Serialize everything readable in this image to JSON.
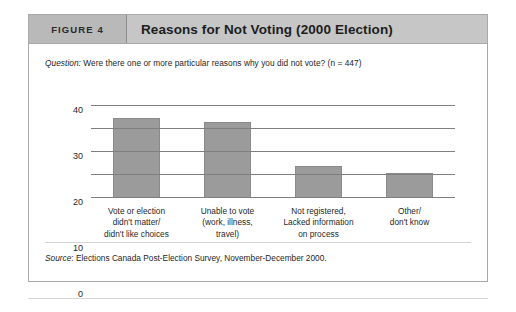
{
  "figure": {
    "number_label": "FIGURE 4",
    "title": "Reasons for Not Voting (2000 Election)",
    "question_lead": "Question:",
    "question_text": " Were there one or more particular reasons why you did not vote? (n = 447)",
    "source_lead": "Source",
    "source_text": ": Elections Canada Post-Election Survey, November-December 2000."
  },
  "colors": {
    "header_band": "#c6c6c6",
    "header_number_band": "#b9b9b9",
    "bar_fill": "#9b9b9b",
    "bar_stroke": "#8a8a8a",
    "gridline": "#7f7f7f",
    "box_border": "#a9a9a9"
  },
  "chart_data": {
    "type": "bar",
    "title": "Reasons for Not Voting (2000 Election)",
    "xlabel": "",
    "ylabel": "",
    "ylim": [
      0,
      40
    ],
    "yticks": [
      0,
      10,
      20,
      30,
      40
    ],
    "ytick_labels": [
      "0",
      "10",
      "20",
      "30",
      "40"
    ],
    "grid": true,
    "legend": null,
    "categories": [
      "Vote or election didn't matter/ didn't like choices",
      "Unable to vote (work, illness, travel)",
      "Not registered, Lacked information on process",
      "Other/ don't know"
    ],
    "category_lines": [
      [
        "Vote or election",
        "didn't matter/",
        "didn't like choices"
      ],
      [
        "Unable to vote",
        "(work, illness,",
        "travel)"
      ],
      [
        "Not registered,",
        "Lacked information",
        "on process"
      ],
      [
        "Other/",
        "don't know"
      ]
    ],
    "values": [
      35,
      33,
      14,
      11
    ],
    "annotation": "Question: Were there one or more particular reasons why you did not vote? (n = 447)",
    "source": "Source: Elections Canada Post-Election Survey, November-December 2000."
  }
}
